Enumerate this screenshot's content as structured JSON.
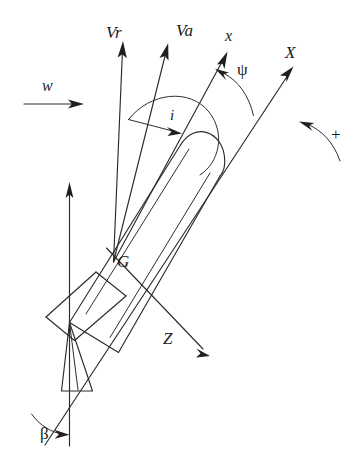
{
  "figure": {
    "kind": "technical-line-diagram",
    "background_color": "#ffffff",
    "line_color": "#2b2b2b"
  },
  "labels": {
    "relative_velocity": "Vr",
    "absolute_velocity": "Va",
    "body_x_axis": "x",
    "earth_X_axis": "X",
    "earth_Z_axis": "Z",
    "heading_angle": "ψ",
    "incidence_angle": "i",
    "drift_angle": "β",
    "center_of_gravity": "G",
    "current_velocity": "w",
    "positive_rotation": "+"
  },
  "vectors": [
    {
      "name": "Vr",
      "label": "Vr",
      "origin": "G",
      "direction_deg_from_east": 85
    },
    {
      "name": "Va",
      "label": "Va",
      "origin": "G",
      "direction_deg_from_east": 75
    },
    {
      "name": "x",
      "label": "x",
      "origin": "G",
      "direction_deg_from_east": 62
    },
    {
      "name": "X",
      "label": "X",
      "origin": "stern",
      "direction_deg_from_east": 35
    },
    {
      "name": "Z",
      "label": "Z",
      "origin": "G",
      "direction_deg_from_east": -40
    },
    {
      "name": "w",
      "label": "w",
      "origin": "free-stream",
      "direction_deg_from_east": 0
    },
    {
      "name": "vertical-reference",
      "label": "",
      "origin": "stern",
      "direction_deg_from_east": 90
    }
  ],
  "angles": [
    {
      "name": "incidence",
      "label": "i",
      "between": [
        "Vr",
        "x"
      ]
    },
    {
      "name": "heading",
      "label": "ψ",
      "between": [
        "X",
        "x"
      ]
    },
    {
      "name": "drift",
      "label": "β",
      "between": [
        "X",
        "vertical-reference"
      ]
    }
  ],
  "annotations": {
    "rotation_sense": "counter-clockwise-positive",
    "rotation_symbol": "+"
  },
  "label_positions": {
    "Vr": {
      "x": 106,
      "y": 24,
      "size": 17
    },
    "Va": {
      "x": 176,
      "y": 22,
      "size": 17
    },
    "x": {
      "x": 225,
      "y": 28,
      "size": 16
    },
    "X": {
      "x": 285,
      "y": 44,
      "size": 17
    },
    "psi": {
      "x": 237,
      "y": 61,
      "size": 17
    },
    "i": {
      "x": 170,
      "y": 108,
      "size": 15
    },
    "w": {
      "x": 42,
      "y": 78,
      "size": 16
    },
    "plus": {
      "x": 331,
      "y": 126,
      "size": 17
    },
    "G": {
      "x": 117,
      "y": 253,
      "size": 17
    },
    "Z": {
      "x": 163,
      "y": 330,
      "size": 17
    },
    "beta": {
      "x": 40,
      "y": 425,
      "size": 17
    }
  }
}
